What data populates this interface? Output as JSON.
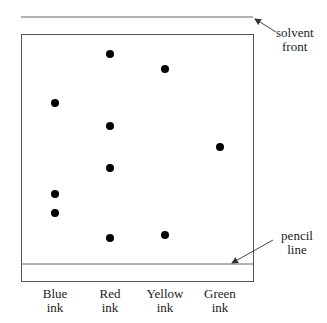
{
  "diagram": {
    "type": "paper chromatography chromatogram",
    "annotations": {
      "solvent_front": {
        "line1": "solvent",
        "line2": "front"
      },
      "pencil_line": {
        "line1": "pencil",
        "line2": "line"
      }
    },
    "lanes": [
      {
        "name": "Blue ink",
        "line1": "Blue",
        "line2": "ink",
        "x": 55,
        "spots_y": [
          103,
          194,
          213
        ]
      },
      {
        "name": "Red ink",
        "line1": "Red",
        "line2": "ink",
        "x": 110,
        "spots_y": [
          54,
          126,
          168,
          238
        ]
      },
      {
        "name": "Yellow ink",
        "line1": "Yellow",
        "line2": "ink",
        "x": 165,
        "spots_y": [
          69,
          235
        ]
      },
      {
        "name": "Green ink",
        "line1": "Green",
        "line2": "ink",
        "x": 220,
        "spots_y": [
          147
        ]
      }
    ],
    "colors": {
      "line": "#555555",
      "spot": "#000000",
      "text": "#222222"
    }
  }
}
